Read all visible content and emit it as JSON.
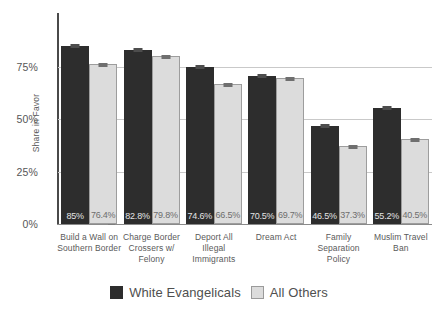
{
  "chart_data": {
    "type": "bar",
    "title": "",
    "xlabel": "",
    "ylabel": "Share in Favor",
    "ylim": [
      0,
      100
    ],
    "yticks": [
      0,
      25,
      50,
      75
    ],
    "ytick_labels": [
      "0%",
      "25%",
      "50%",
      "75%"
    ],
    "grid": "horizontal gridlines at 25%, 50%, 75%",
    "legend_position": "bottom-center",
    "categories": [
      "Build a Wall on Southern Border",
      "Charge Border Crossers w/ Felony",
      "Deport All Illegal Immigrants",
      "Dream Act",
      "Family Separation Policy",
      "Muslim Travel Ban"
    ],
    "series": [
      {
        "name": "White Evangelicals",
        "color": "#2d2d2d",
        "values": [
          85.0,
          82.8,
          74.6,
          70.5,
          46.5,
          55.2
        ],
        "labels": [
          "85%",
          "82.8%",
          "74.6%",
          "70.5%",
          "46.5%",
          "55.2%"
        ]
      },
      {
        "name": "All Others",
        "color": "#dcdcdc",
        "values": [
          76.4,
          79.8,
          66.5,
          69.7,
          37.3,
          40.5
        ],
        "labels": [
          "76.4%",
          "79.8%",
          "66.5%",
          "69.7%",
          "37.3%",
          "40.5%"
        ]
      }
    ],
    "annotations": "Each bar has a small error-bar cap at its top."
  },
  "axis": {
    "y_title": "Share in Favor",
    "y_tick_labels": [
      "75%",
      "50%",
      "25%",
      "0%"
    ]
  },
  "categories_display": [
    [
      "Build a Wall on",
      "Southern Border"
    ],
    [
      "Charge Border",
      "Crossers w/",
      "Felony"
    ],
    [
      "Deport All",
      "Illegal",
      "Immigrants"
    ],
    [
      "Dream Act"
    ],
    [
      "Family",
      "Separation",
      "Policy"
    ],
    [
      "Muslim Travel",
      "Ban"
    ]
  ],
  "legend": {
    "items": [
      {
        "label": "White Evangelicals",
        "swatch": "dark-square-swatch"
      },
      {
        "label": "All Others",
        "swatch": "light-square-swatch"
      }
    ]
  },
  "colors": {
    "series_white_evangelicals": "#2d2d2d",
    "series_all_others": "#dcdcdc",
    "gridline": "#c9c9c9",
    "axis": "#4a4a4a",
    "text": "#565656"
  }
}
